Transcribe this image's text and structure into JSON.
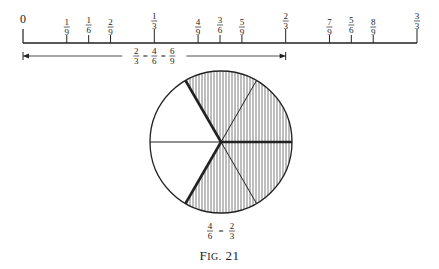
{
  "number_line": {
    "zero_label": "0",
    "x_start": 23,
    "x_end": 417,
    "y": 43,
    "ticks": [
      {
        "num": "1",
        "den": "9",
        "value": 0.1111
      },
      {
        "num": "1",
        "den": "6",
        "value": 0.1667
      },
      {
        "num": "2",
        "den": "9",
        "value": 0.2222
      },
      {
        "num": "1",
        "den": "3",
        "value": 0.3333
      },
      {
        "num": "4",
        "den": "9",
        "value": 0.4444
      },
      {
        "num": "3",
        "den": "6",
        "value": 0.5
      },
      {
        "num": "5",
        "den": "9",
        "value": 0.5556
      },
      {
        "num": "2",
        "den": "3",
        "value": 0.6667
      },
      {
        "num": "7",
        "den": "9",
        "value": 0.7778
      },
      {
        "num": "5",
        "den": "6",
        "value": 0.8333
      },
      {
        "num": "8",
        "den": "9",
        "value": 0.8889
      },
      {
        "num": "3",
        "den": "3",
        "value": 1.0
      }
    ]
  },
  "span_arrow": {
    "from": 0,
    "to": 0.6667,
    "label": [
      {
        "num": "2",
        "den": "3"
      },
      {
        "num": "4",
        "den": "6"
      },
      {
        "num": "6",
        "den": "9"
      }
    ],
    "sep": "="
  },
  "circle": {
    "sectors": 6,
    "shaded_sectors": 4,
    "label": [
      {
        "num": "4",
        "den": "6"
      },
      {
        "num": "2",
        "den": "3"
      }
    ],
    "sep": "="
  },
  "caption": {
    "prefix": "F",
    "small_caps": "IG.",
    "number": "21"
  }
}
